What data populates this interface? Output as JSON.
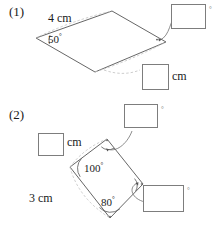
{
  "page": {
    "background": "#ffffff",
    "line_color": "#555555",
    "dash_color": "#b9b9b9",
    "box_border": "#7d7d7d"
  },
  "problems": [
    {
      "number": "(1)",
      "shape": "parallelogram",
      "given": [
        {
          "name": "side-4cm",
          "value": "4",
          "unit": "cm",
          "text": "4 cm"
        },
        {
          "name": "angle-50",
          "value": "50",
          "unit": "°",
          "text": "50"
        }
      ],
      "answers": [
        {
          "name": "angle-answer-box",
          "value": "",
          "unit": "°",
          "unit_position": "right"
        },
        {
          "name": "length-answer-box",
          "value": "",
          "unit": "cm",
          "unit_position": "right"
        }
      ]
    },
    {
      "number": "(2)",
      "shape": "rhombus",
      "given": [
        {
          "name": "side-3cm",
          "value": "3",
          "unit": "cm",
          "text": "3 cm"
        },
        {
          "name": "angle-100",
          "value": "100",
          "unit": "°",
          "text": "100"
        },
        {
          "name": "angle-80",
          "value": "80",
          "unit": "°",
          "text": "80"
        }
      ],
      "answers": [
        {
          "name": "length-answer-box",
          "value": "",
          "unit": "cm",
          "unit_position": "right"
        },
        {
          "name": "angle-answer-box-top",
          "value": "",
          "unit": "°",
          "unit_position": "right"
        },
        {
          "name": "angle-answer-box-right",
          "value": "",
          "unit": "°",
          "unit_position": "right"
        }
      ]
    }
  ],
  "labels": {
    "q1_number": "(1)",
    "q1_side": "4 cm",
    "q1_angle": "50",
    "q1_box_cm_unit": "cm",
    "q2_number": "(2)",
    "q2_box_cm_unit": "cm",
    "q2_angle_left": "100",
    "q2_angle_bottom": "80",
    "q2_side": "3 cm",
    "degree_symbol": "°"
  }
}
